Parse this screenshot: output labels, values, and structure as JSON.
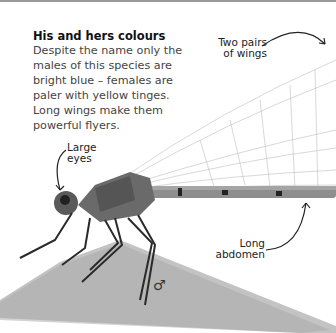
{
  "info": {
    "title": "His and hers colours",
    "body": "Despite the name only the males of this species are bright blue – females are paler with yellow tinges. Long wings make them powerful flyers."
  },
  "labels": {
    "wings": "Two pairs of wings",
    "eyes": "Large eyes",
    "abdomen": "Long abdomen"
  },
  "sex_symbol": "♂",
  "colors": {
    "background": "#ffffff",
    "text": "#444444",
    "title": "#111111",
    "body_gray": "#777777",
    "stem": "#b5b5b5"
  }
}
